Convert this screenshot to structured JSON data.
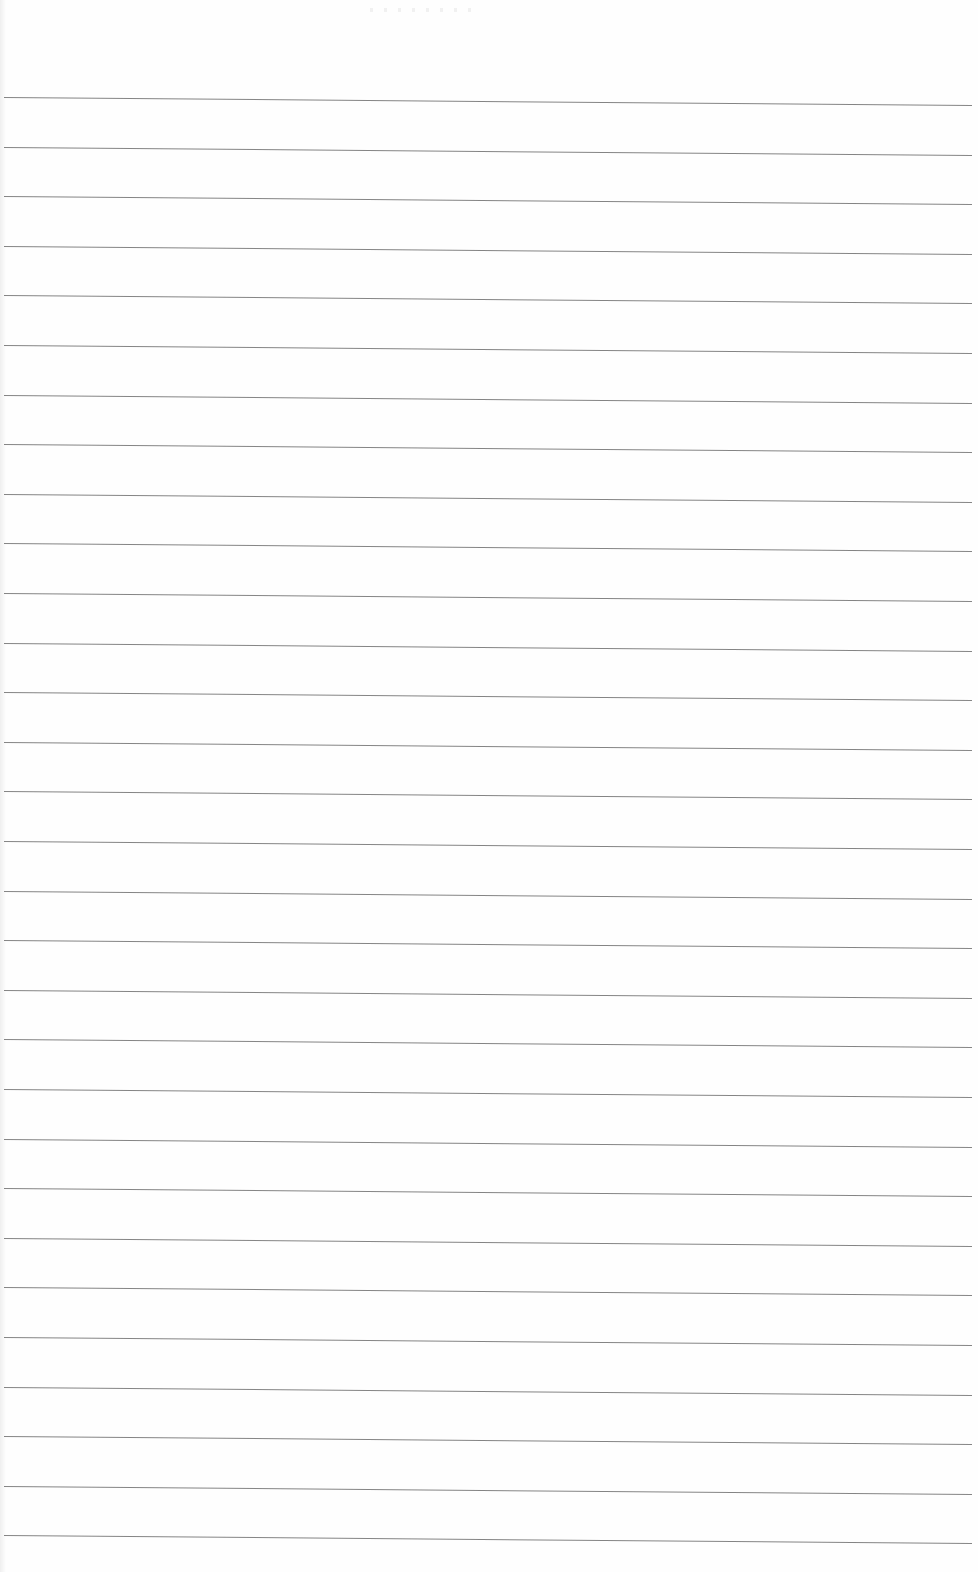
{
  "document": {
    "type": "lined-paper",
    "line_count": 30,
    "first_line_y": 97,
    "line_spacing": 49.6,
    "line_color": "#6f6f6f",
    "background_color": "#fefefe"
  }
}
